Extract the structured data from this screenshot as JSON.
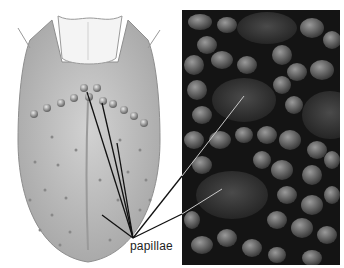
{
  "figure": {
    "left_panel": "Illustration of human tongue (dorsal view) with papillae dots",
    "right_panel": "Scanning electron micrograph of tongue surface showing papillae",
    "label": "papillae",
    "colors": {
      "tongue_fill": "#c9c9c9",
      "tongue_shade": "#a8a8a8",
      "micrograph_bg": "#141414",
      "micrograph_blob": "#6e6e6e",
      "leader_line_left": "#111111",
      "leader_line_right": "#bdbdbd"
    },
    "leader_lines": [
      {
        "from": [
          87,
          92
        ],
        "to": [
          133,
          238
        ]
      },
      {
        "from": [
          102,
          103
        ],
        "to": [
          133,
          238
        ]
      },
      {
        "from": [
          117,
          143
        ],
        "to": [
          133,
          238
        ]
      },
      {
        "from": [
          102,
          215
        ],
        "to": [
          133,
          238
        ]
      },
      {
        "from": [
          244,
          96
        ],
        "to": [
          133,
          238
        ]
      },
      {
        "from": [
          222,
          189
        ],
        "to": [
          133,
          238
        ]
      }
    ]
  }
}
